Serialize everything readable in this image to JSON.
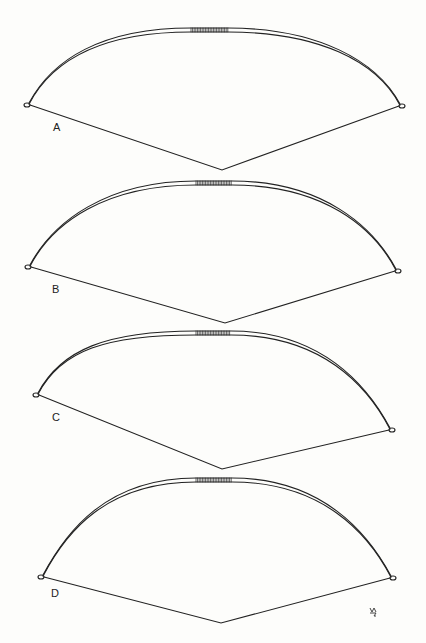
{
  "figure": {
    "colors": {
      "ink": "#222222",
      "background": "#fdfdfb"
    },
    "bows": [
      {
        "label": "A",
        "label_pos": [
          53,
          121
        ],
        "left_tip": [
          27,
          105
        ],
        "right_tip": [
          402,
          106
        ],
        "grip": [
          191,
          228,
          32
        ],
        "string_low": [
          222,
          170
        ],
        "apex_y": 28
      },
      {
        "label": "B",
        "label_pos": [
          52,
          283
        ],
        "left_tip": [
          28,
          267
        ],
        "right_tip": [
          398,
          271
        ],
        "grip": [
          196,
          232,
          183
        ],
        "string_low": [
          225,
          323
        ],
        "apex_y": 181
      },
      {
        "label": "C",
        "label_pos": [
          52,
          411
        ],
        "left_tip": [
          36,
          395
        ],
        "right_tip": [
          392,
          430
        ],
        "grip": [
          196,
          231,
          333
        ],
        "string_low": [
          222,
          469
        ],
        "apex_y": 331
      },
      {
        "label": "D",
        "label_pos": [
          51,
          587
        ],
        "left_tip": [
          41,
          577
        ],
        "right_tip": [
          393,
          578
        ],
        "grip": [
          196,
          232,
          480
        ],
        "string_low": [
          221,
          623
        ],
        "apex_y": 478
      }
    ],
    "signature_mark": {
      "pos": [
        373,
        611
      ]
    }
  }
}
